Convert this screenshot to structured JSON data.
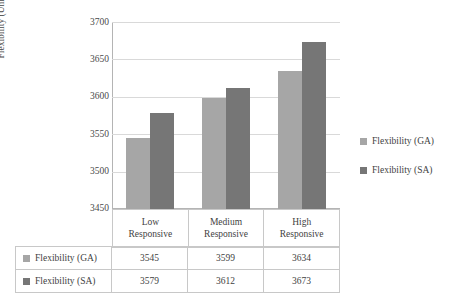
{
  "chart_data": {
    "type": "bar",
    "title": "",
    "xlabel": "",
    "ylabel": "Flexibility (Units)",
    "categories": [
      "Low\nResponsive",
      "Medium\nResponsive",
      "High\nResponsive"
    ],
    "category_lines": [
      [
        "Low",
        "Responsive"
      ],
      [
        "Medium",
        "Responsive"
      ],
      [
        "High",
        "Responsive"
      ]
    ],
    "series": [
      {
        "name": "Flexibility (GA)",
        "values": [
          3545,
          3599,
          3634
        ],
        "color": "#a6a6a6"
      },
      {
        "name": "Flexibility (SA)",
        "values": [
          3579,
          3612,
          3673
        ],
        "color": "#767676"
      }
    ],
    "ylim": [
      3450,
      3700
    ],
    "yticks": [
      3450,
      3500,
      3550,
      3600,
      3650,
      3700
    ],
    "ytick_labels": [
      "3450",
      "3500",
      "3550",
      "3600",
      "3650",
      "3700"
    ],
    "grid": true,
    "legend_position": "right",
    "has_data_table": true
  },
  "legend": {
    "items": [
      {
        "label": "Flexibility (GA)"
      },
      {
        "label": "Flexibility (SA)"
      }
    ]
  },
  "table": {
    "rows": [
      {
        "header": "Flexibility (GA)",
        "cells": [
          "3545",
          "3599",
          "3634"
        ]
      },
      {
        "header": "Flexibility (SA)",
        "cells": [
          "3579",
          "3612",
          "3673"
        ]
      }
    ]
  }
}
